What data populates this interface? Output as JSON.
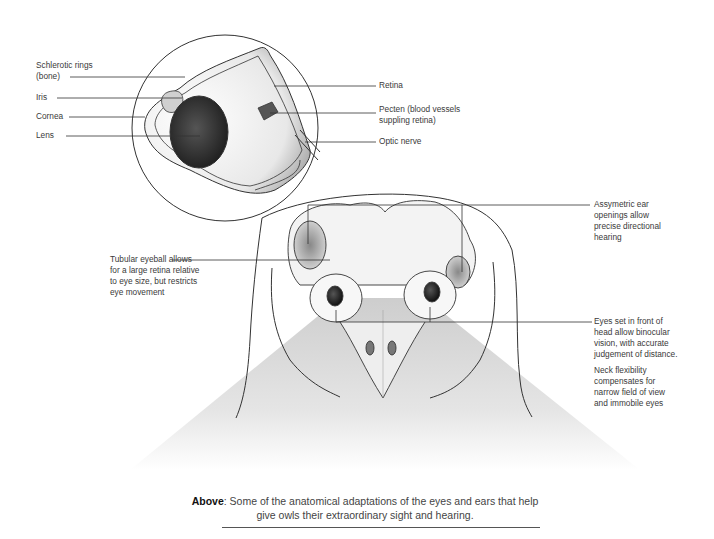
{
  "eye_cross_section": {
    "labels": {
      "schlerotic_rings": [
        "Schlerotic rings",
        "(bone)"
      ],
      "iris": "Iris",
      "cornea": "Cornea",
      "lens": "Lens",
      "retina": "Retina",
      "pecten": [
        "Pecten (blood vessels",
        "suppling retina)"
      ],
      "optic_nerve": "Optic nerve"
    }
  },
  "owl_head": {
    "labels": {
      "tubular_eyeball": [
        "Tubular eyeball allows",
        "for a large retina relative",
        "to eye size, but restricts",
        "eye movement"
      ],
      "ear_openings": [
        "Assymetric ear",
        "openings allow",
        "precise directional",
        "hearing"
      ],
      "binocular": [
        "Eyes set in front of",
        "head allow binocular",
        "vision, with accurate",
        "judgement of distance."
      ],
      "neck": [
        "Neck flexibility",
        "compensates for",
        "narrow field of view",
        "and immobile eyes"
      ]
    }
  },
  "caption": {
    "lead": "Above",
    "text": ": Some of the anatomical adaptations of the eyes and ears that help give owls their extraordinary sight and hearing."
  },
  "colors": {
    "line": "#333333",
    "field_of_view": "#d6d6d6",
    "lens_fill": "#2a2a2a"
  }
}
